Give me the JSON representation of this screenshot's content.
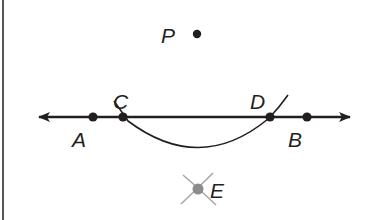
{
  "diagram": {
    "type": "geometry-construction",
    "colors": {
      "ink": "#231f20",
      "construction_mark": "#a0a0a0",
      "point_E_fill": "#8c8c8c",
      "border": "#555555"
    },
    "line": {
      "name": "line AB",
      "arrows": "both",
      "y": 117,
      "x_start": 37,
      "x_end": 352
    },
    "points": [
      {
        "label": "P",
        "x": 197,
        "y": 34,
        "label_x": 163,
        "label_y": 42
      },
      {
        "label": "A",
        "x": 93,
        "y": 117,
        "label_x": 72,
        "label_y": 144
      },
      {
        "label": "C",
        "x": 123,
        "y": 117,
        "label_x": 114,
        "label_y": 108
      },
      {
        "label": "D",
        "x": 270,
        "y": 117,
        "label_x": 250,
        "label_y": 108
      },
      {
        "label": "B",
        "x": 307,
        "y": 117,
        "label_x": 288,
        "label_y": 144
      },
      {
        "label": "E",
        "x": 198,
        "y": 189,
        "label_x": 210,
        "label_y": 197
      }
    ],
    "arc": {
      "description": "arc centered at P intersecting line at C and D",
      "start": [
        114,
        101
      ],
      "end": [
        288,
        95
      ]
    },
    "construction_marks": {
      "description": "two small intersecting arcs at E",
      "at": "E"
    }
  }
}
